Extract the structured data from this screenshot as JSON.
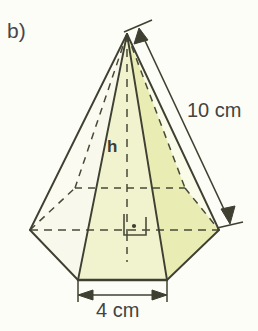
{
  "figure": {
    "part_label": "b)",
    "shape_name": "hexagonal-pyramid",
    "height_label": "h",
    "slant_measure": "10 cm",
    "base_measure": "4 cm",
    "right_angle_marker": "right-angle-with-dot"
  },
  "colors": {
    "stroke": "#3f4031",
    "face_light": "#f7f8e4",
    "face_mid": "#eef0c6",
    "face_dark": "#e6eaa8",
    "background": "#fdfdf8",
    "text": "#44443f"
  },
  "geometry": {
    "apex": [
      127,
      34
    ],
    "base_vertices": {
      "front_left": [
        78,
        280
      ],
      "front_right": [
        167,
        280
      ],
      "right": [
        219,
        230
      ],
      "back_right": [
        185,
        188
      ],
      "back_left": [
        75,
        188
      ],
      "left": [
        30,
        230
      ]
    },
    "center": [
      127,
      234
    ],
    "dimension_slant": {
      "from": [
        140,
        28
      ],
      "to": [
        228,
        224
      ]
    },
    "dimension_base": {
      "y": 295,
      "from_x": 78,
      "to_x": 167
    }
  }
}
